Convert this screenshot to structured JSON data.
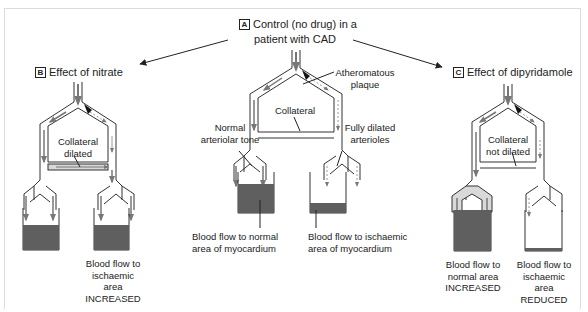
{
  "panels": {
    "A": {
      "tag": "A",
      "title_line1": "Control (no drug) in a",
      "title_line2": "patient with CAD",
      "labels": {
        "plaque": "Atheromatous plaque",
        "collateral": "Collateral",
        "normal_tone": "Normal arteriolar tone",
        "dilated": "Fully dilated arterioles",
        "normal_flow": "Blood flow to normal area of myocardium",
        "ischaemic_flow": "Blood flow to ischaemic area of myocardium"
      },
      "fill_levels": {
        "normal": 0.85,
        "ischaemic": 0.3
      }
    },
    "B": {
      "tag": "B",
      "title": "Effect of nitrate",
      "labels": {
        "collateral": "Collateral dilated",
        "ischaemic_flow_l1": "Blood flow to",
        "ischaemic_flow_l2": "ischaemic",
        "ischaemic_flow_l3": "area",
        "ischaemic_flow_l4": "INCREASED"
      },
      "fill_levels": {
        "normal": 0.6,
        "ischaemic": 0.6
      }
    },
    "C": {
      "tag": "C",
      "title": "Effect of dipyridamole",
      "labels": {
        "collateral_l1": "Collateral",
        "collateral_l2": "not dilated",
        "normal_flow_l1": "Blood flow to",
        "normal_flow_l2": "normal area",
        "normal_flow_l3": "INCREASED",
        "ischaemic_flow_l1": "Blood flow to",
        "ischaemic_flow_l2": "ischaemic",
        "ischaemic_flow_l3": "area",
        "ischaemic_flow_l4": "REDUCED"
      },
      "fill_levels": {
        "normal": 1.0,
        "ischaemic": 0.06
      }
    }
  },
  "colors": {
    "line": "#333333",
    "fill_dark": "#5f5f5f",
    "arrow_grey": "#7a7a7a",
    "vessel_shade": "#d9d9d9",
    "plaque": "#111111",
    "frame": "#dcdcdc"
  }
}
